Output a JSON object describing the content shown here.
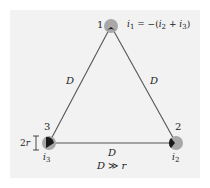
{
  "diagram": {
    "type": "three-wire transmission line (equilateral triangle)",
    "colors": {
      "background": "#f2f2f2",
      "line": "#555555",
      "conductor_fill": "#a8a8a8",
      "conductor_core": "#1a1a1a"
    },
    "nodes": [
      {
        "id": "1",
        "label": "1",
        "current": "i1",
        "x": 111,
        "y": 26
      },
      {
        "id": "2",
        "label": "2",
        "current": "i2",
        "x": 176,
        "y": 143
      },
      {
        "id": "3",
        "label": "3",
        "current": "i3",
        "x": 49,
        "y": 143
      }
    ],
    "edges": [
      {
        "from": "1",
        "to": "3",
        "label": "D"
      },
      {
        "from": "1",
        "to": "2",
        "label": "D"
      },
      {
        "from": "3",
        "to": "2",
        "label": "D"
      }
    ],
    "annotations": {
      "current_relation": {
        "lhs": "i",
        "lhs_sub": "1",
        "eq": " = −(",
        "a": "i",
        "a_sub": "2",
        "plus": " + ",
        "b": "i",
        "b_sub": "3",
        "close": ")"
      },
      "radius_label": {
        "prefix": "2",
        "var": "r"
      },
      "condition": {
        "lhs": "D",
        "op": " ≫ ",
        "rhs": "r"
      },
      "i2": {
        "var": "i",
        "sub": "2"
      },
      "i3": {
        "var": "i",
        "sub": "3"
      }
    }
  }
}
